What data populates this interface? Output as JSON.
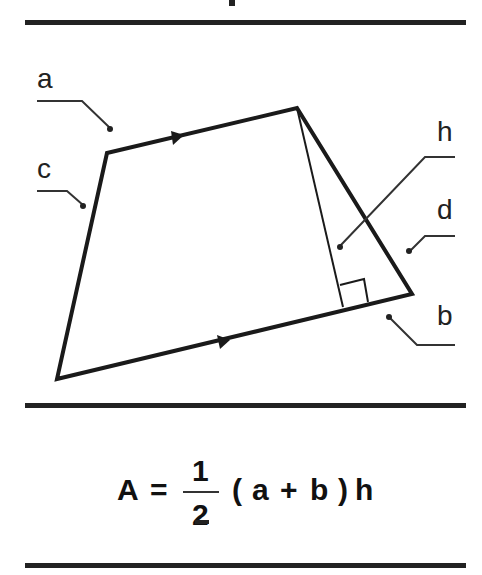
{
  "diagram": {
    "shape": "trapezoid",
    "labels": {
      "a": "a",
      "b": "b",
      "c": "c",
      "d": "d",
      "h": "h"
    },
    "vertices": [
      [
        107,
        153
      ],
      [
        297,
        108
      ],
      [
        412,
        294
      ],
      [
        57,
        379
      ]
    ],
    "height_foot": [
      343,
      307
    ],
    "parallel_marks": "arrow on sides a and b"
  },
  "formula": {
    "lhs": "A",
    "equals": "=",
    "numerator": "1",
    "denominator": "2",
    "open_paren": "(",
    "a": "a",
    "plus": "+",
    "b": "b",
    "close_paren": ")",
    "h": "h"
  }
}
